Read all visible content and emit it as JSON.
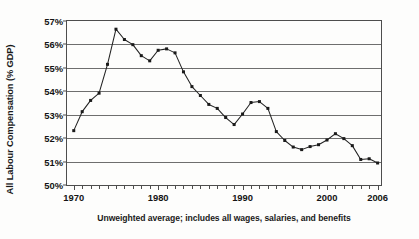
{
  "chart_data": {
    "type": "line",
    "title": "",
    "subtitle": "",
    "xlabel": "",
    "ylabel": "All Labour Compensation (% GDP)",
    "caption": "Unweighted average; includes all wages, salaries, and benefits",
    "grid": true,
    "legend": false,
    "xlim": [
      1969.2,
      2006.4
    ],
    "ylim": [
      50,
      57
    ],
    "ytick_labels": [
      "50%",
      "51%",
      "52%",
      "53%",
      "54%",
      "55%",
      "56%",
      "57%"
    ],
    "ytick_values": [
      50,
      51,
      52,
      53,
      54,
      55,
      56,
      57
    ],
    "xtick_labels": [
      "1970",
      "1980",
      "1990",
      "2000",
      "2006"
    ],
    "xtick_values": [
      1970,
      1980,
      1990,
      2000,
      2006
    ],
    "xtick_minor_step": 1,
    "marker": "square",
    "line_color": "#222222",
    "marker_color": "#1a1a1a",
    "grid_color": "#6e6e6e",
    "x": [
      1970,
      1971,
      1972,
      1973,
      1974,
      1975,
      1976,
      1977,
      1978,
      1979,
      1980,
      1981,
      1982,
      1983,
      1984,
      1985,
      1986,
      1987,
      1988,
      1989,
      1990,
      1991,
      1992,
      1993,
      1994,
      1995,
      1996,
      1997,
      1998,
      1999,
      2000,
      2001,
      2002,
      2003,
      2004,
      2005,
      2006
    ],
    "values": [
      52.32,
      53.13,
      53.61,
      53.92,
      55.15,
      56.65,
      56.21,
      55.99,
      55.52,
      55.3,
      55.75,
      55.81,
      55.64,
      54.83,
      54.2,
      53.82,
      53.44,
      53.27,
      52.88,
      52.58,
      53.03,
      53.52,
      53.56,
      53.27,
      52.28,
      51.9,
      51.62,
      51.51,
      51.64,
      51.72,
      51.92,
      52.19,
      51.98,
      51.68,
      51.09,
      51.12,
      50.94
    ]
  }
}
